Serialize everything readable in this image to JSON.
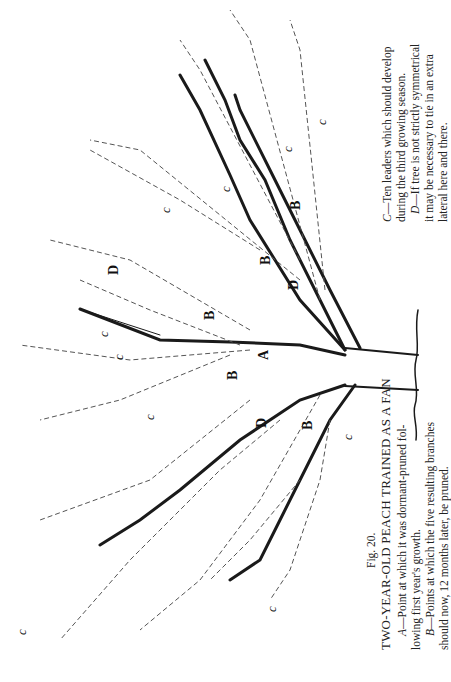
{
  "figure": {
    "number": "Fig. 20.",
    "title": "TWO-YEAR-OLD PEACH TRAINED AS A FAN",
    "legend": {
      "A": {
        "key": "A",
        "text": "—Point at which it was dormant-pruned following first year's growth.",
        "line1": "—Point at which it was dormant-pruned fol-",
        "line2": "lowing first year's growth."
      },
      "B": {
        "key": "B",
        "text": "—Points at which the five resulting branches should now, 12 months later, be pruned.",
        "line1": "—Points at which the five resulting branches",
        "line2": "should now, 12 months later, be pruned."
      },
      "C": {
        "key": "C",
        "text": "—Ten leaders which should develop during the third growing season.",
        "line1": "—Ten leaders which should develop",
        "line2": "during the third growing season."
      },
      "D": {
        "key": "D",
        "text": "—If tree is not strictly symmetrical it may be necessary to tie in an extra lateral here and there.",
        "line1": "—If tree is not strictly symmetrical",
        "line2": "it may be necessary to tie in an extra",
        "line3": "lateral here and there."
      }
    },
    "diagram_labels": {
      "a": "A",
      "b": "B",
      "c": "c",
      "d": "D"
    },
    "colors": {
      "ink": "#1a1a1a",
      "paper": "#ffffff",
      "dashed": "#555555"
    }
  }
}
